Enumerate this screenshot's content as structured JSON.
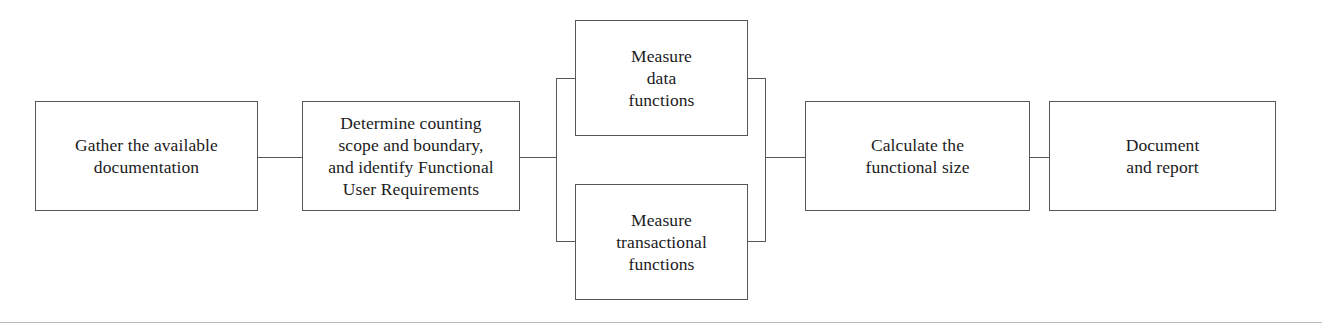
{
  "diagram": {
    "style": {
      "box_border_color": "#55575a",
      "connector_color": "#55575a",
      "text_color": "#1b1b1d",
      "background_color": "#ffffff",
      "rule_color": "#b9bbbd"
    },
    "nodes": [
      {
        "id": "gather-documentation",
        "label": "Gather the available\ndocumentation",
        "x": 35,
        "y": 101,
        "w": 223,
        "h": 110
      },
      {
        "id": "determine-scope",
        "label": "Determine counting\nscope and boundary,\nand identify Functional\nUser Requirements",
        "x": 302,
        "y": 101,
        "w": 218,
        "h": 110
      },
      {
        "id": "measure-data-functions",
        "label": "Measure\ndata\nfunctions",
        "x": 575,
        "y": 20,
        "w": 173,
        "h": 116
      },
      {
        "id": "measure-transactional-functions",
        "label": "Measure\ntransactional\nfunctions",
        "x": 575,
        "y": 184,
        "w": 173,
        "h": 116
      },
      {
        "id": "calculate-functional-size",
        "label": "Calculate the\nfunctional size",
        "x": 805,
        "y": 101,
        "w": 225,
        "h": 110
      },
      {
        "id": "document-and-report",
        "label": "Document\nand report",
        "x": 1049,
        "y": 101,
        "w": 227,
        "h": 110
      }
    ],
    "connectors": [
      {
        "id": "link-gather-to-determine",
        "type": "h",
        "x": 258,
        "y": 157,
        "length": 44
      },
      {
        "id": "link-determine-to-split-bus",
        "type": "h",
        "x": 520,
        "y": 157,
        "length": 37
      },
      {
        "id": "split-bus-vertical",
        "type": "v",
        "x": 556,
        "y": 78,
        "length": 164
      },
      {
        "id": "split-bus-to-data-functions",
        "type": "h",
        "x": 556,
        "y": 78,
        "length": 19
      },
      {
        "id": "split-bus-to-transactional-functions",
        "type": "h",
        "x": 556,
        "y": 241,
        "length": 19
      },
      {
        "id": "data-functions-to-merge-bus",
        "type": "h",
        "x": 748,
        "y": 78,
        "length": 18
      },
      {
        "id": "transactional-functions-to-merge-bus",
        "type": "h",
        "x": 748,
        "y": 241,
        "length": 18
      },
      {
        "id": "merge-bus-vertical",
        "type": "v",
        "x": 765,
        "y": 78,
        "length": 164
      },
      {
        "id": "merge-bus-to-calculate",
        "type": "h",
        "x": 765,
        "y": 157,
        "length": 40
      },
      {
        "id": "link-calculate-to-document",
        "type": "h",
        "x": 1030,
        "y": 157,
        "length": 19
      }
    ],
    "page_rule": {
      "id": "page-bottom-rule",
      "y": 322
    }
  }
}
